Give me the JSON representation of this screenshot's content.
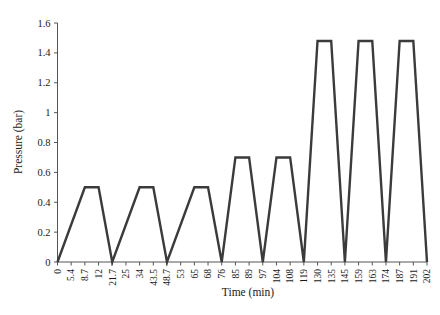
{
  "chart_data": {
    "type": "line",
    "title": "",
    "xlabel": "Time (min)",
    "ylabel": "Pressure (bar)",
    "xlim": [
      0,
      202
    ],
    "ylim": [
      0,
      1.6
    ],
    "grid": false,
    "legend": null,
    "line_color": "#3b3b3b",
    "y_ticks": [
      0,
      0.2,
      0.4,
      0.6,
      0.8,
      1,
      1.2,
      1.4,
      1.6
    ],
    "y_tick_labels": [
      "0",
      "0.2",
      "0.4",
      "0.6",
      "0.8",
      "1",
      "1.2",
      "1.4",
      "1.6"
    ],
    "x_ticks": [
      0,
      5.4,
      8.7,
      12,
      21.7,
      25,
      34,
      43.5,
      48.7,
      53,
      65,
      68,
      76,
      85,
      89,
      97,
      104,
      108,
      119,
      130,
      135,
      145,
      159,
      163,
      174,
      187,
      191,
      202
    ],
    "x_tick_labels": [
      "0",
      "5.4",
      "8.7",
      "12",
      "21.7",
      "25",
      "34",
      "43.5",
      "48.7",
      "53",
      "65",
      "68",
      "76",
      "85",
      "89",
      "97",
      "104",
      "108",
      "119",
      "130",
      "135",
      "145",
      "159",
      "163",
      "174",
      "187",
      "191",
      "202"
    ],
    "x": [
      0,
      5.4,
      8.7,
      12,
      21.7,
      25,
      34,
      43.5,
      48.7,
      53,
      65,
      68,
      76,
      85,
      89,
      97,
      104,
      108,
      119,
      130,
      135,
      145,
      159,
      163,
      174,
      187,
      191,
      202
    ],
    "values": [
      0,
      0,
      0.5,
      0.5,
      0,
      0,
      0.5,
      0.5,
      0,
      0,
      0.5,
      0.5,
      0,
      0.7,
      0.7,
      0,
      0.7,
      0.7,
      0,
      1.48,
      1.48,
      0,
      1.48,
      1.48,
      0,
      1.48,
      1.48,
      0
    ],
    "pulses": [
      {
        "plateau": 0.5,
        "rise_start": 0,
        "plateau_start": 8.7,
        "plateau_end": 12,
        "fall_end": 21.7
      },
      {
        "plateau": 0.5,
        "rise_start": 21.7,
        "plateau_start": 34,
        "plateau_end": 43.5,
        "fall_end": 48.7
      },
      {
        "plateau": 0.5,
        "rise_start": 48.7,
        "plateau_start": 65,
        "plateau_end": 68,
        "fall_end": 76
      },
      {
        "plateau": 0.7,
        "rise_start": 76,
        "plateau_start": 85,
        "plateau_end": 89,
        "fall_end": 97
      },
      {
        "plateau": 0.7,
        "rise_start": 97,
        "plateau_start": 104,
        "plateau_end": 108,
        "fall_end": 119
      },
      {
        "plateau": 1.48,
        "rise_start": 119,
        "plateau_start": 130,
        "plateau_end": 135,
        "fall_end": 145
      },
      {
        "plateau": 1.48,
        "rise_start": 145,
        "plateau_start": 159,
        "plateau_end": 163,
        "fall_end": 174
      },
      {
        "plateau": 1.48,
        "rise_start": 174,
        "plateau_start": 187,
        "plateau_end": 191,
        "fall_end": 202
      }
    ]
  }
}
